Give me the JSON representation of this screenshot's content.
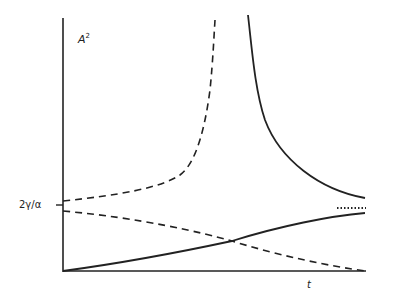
{
  "diagram": {
    "y_axis": {
      "label": "A",
      "label_superscript": "2"
    },
    "x_axis": {
      "label": "t"
    },
    "tick": {
      "label": "2γ/α"
    },
    "curves": [
      {
        "name": "dashed-diverging",
        "style": "dashed",
        "description": "rises from 2γ/α and diverges upward"
      },
      {
        "name": "solid-decaying",
        "style": "solid",
        "description": "descends from infinity toward asymptote"
      },
      {
        "name": "dashed-decaying",
        "style": "dashed",
        "description": "starts just below 2γ/α and decays to zero"
      },
      {
        "name": "solid-growing",
        "style": "solid",
        "description": "rises from zero toward asymptote"
      },
      {
        "name": "asymptote",
        "style": "dotted",
        "description": "limiting value line"
      }
    ],
    "colors": {
      "ink": "#222222",
      "background": "#ffffff"
    }
  }
}
